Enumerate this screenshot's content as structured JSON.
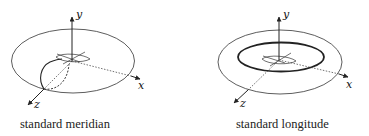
{
  "figure": {
    "panels": [
      {
        "id": "left",
        "caption": "standard meridian",
        "axes": {
          "x": "x",
          "y": "y",
          "z": "z"
        },
        "highlighted_curve": "meridian"
      },
      {
        "id": "right",
        "caption": "standard longitude",
        "axes": {
          "x": "x",
          "y": "y",
          "z": "z"
        },
        "highlighted_curve": "longitude"
      }
    ],
    "colors": {
      "stroke": "#222222",
      "background": "#ffffff"
    }
  }
}
